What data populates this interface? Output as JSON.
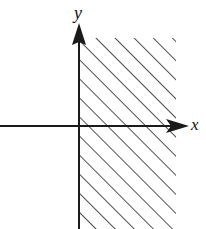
{
  "figure": {
    "width": 206,
    "height": 229,
    "background_color": "#ffffff",
    "ink_color": "#1a1a1a",
    "hatch_color": "#333333"
  },
  "axes": {
    "x_axis": {
      "label": "x",
      "label_x": 191,
      "label_y": 130,
      "label_size": 17,
      "line_y": 126,
      "line_start_x": 0,
      "line_end_x": 171,
      "arrow_tip_x": 189,
      "arrow_base_x": 166,
      "arrow_half_height": 7
    },
    "y_axis": {
      "label": "y",
      "label_x": 74,
      "label_y": 19,
      "label_size": 18,
      "line_x": 79,
      "line_start_y": 229,
      "line_end_y": 42,
      "arrow_tip_y": 23,
      "arrow_base_y": 45,
      "arrow_half_width": 7
    },
    "origin": {
      "x": 79,
      "y": 126
    },
    "stroke_width": 2
  },
  "shaded_region": {
    "description": "hatched region right of the y-axis",
    "left": 79,
    "right": 176,
    "top": 38,
    "bottom": 229,
    "hatch_angle_degrees": -45,
    "hatch_spacing": 13.5,
    "hatch_stroke_width": 1.7
  }
}
